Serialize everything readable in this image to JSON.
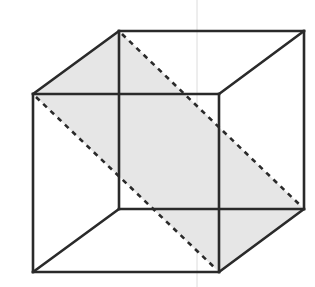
{
  "diagram": {
    "title": "Cube with diagonal cross-section plane",
    "type": "3d-wireframe-cube",
    "colors": {
      "edge": "#2a2a2a",
      "plane_fill": "#e6e6e6",
      "background": "#ffffff",
      "artifact_line": "#dcdcdc"
    },
    "vertices": {
      "front_top_left": [
        33,
        94
      ],
      "front_top_right": [
        219,
        94
      ],
      "front_bottom_left": [
        33,
        272
      ],
      "front_bottom_right": [
        219,
        272
      ],
      "back_top_left": [
        119,
        31
      ],
      "back_top_right": [
        304,
        31
      ],
      "back_bottom_left": [
        119,
        209
      ],
      "back_bottom_right": [
        304,
        209
      ]
    },
    "solid_edges": [
      [
        "front_top_left",
        "front_top_right"
      ],
      [
        "front_top_right",
        "front_bottom_right"
      ],
      [
        "front_bottom_right",
        "front_bottom_left"
      ],
      [
        "front_bottom_left",
        "front_top_left"
      ],
      [
        "back_top_left",
        "back_top_right"
      ],
      [
        "back_top_right",
        "back_bottom_right"
      ],
      [
        "back_bottom_right",
        "back_bottom_left"
      ],
      [
        "back_bottom_left",
        "back_top_left"
      ],
      [
        "front_top_left",
        "back_top_left"
      ],
      [
        "front_top_right",
        "back_top_right"
      ],
      [
        "front_bottom_left",
        "back_bottom_left"
      ],
      [
        "front_bottom_right",
        "back_bottom_right"
      ]
    ],
    "dashed_edges": [
      [
        "back_top_left",
        "back_bottom_right"
      ],
      [
        "front_top_left",
        "front_bottom_right"
      ]
    ],
    "shaded_plane": [
      "back_top_left",
      "front_top_left",
      "front_bottom_right",
      "back_bottom_right"
    ]
  }
}
